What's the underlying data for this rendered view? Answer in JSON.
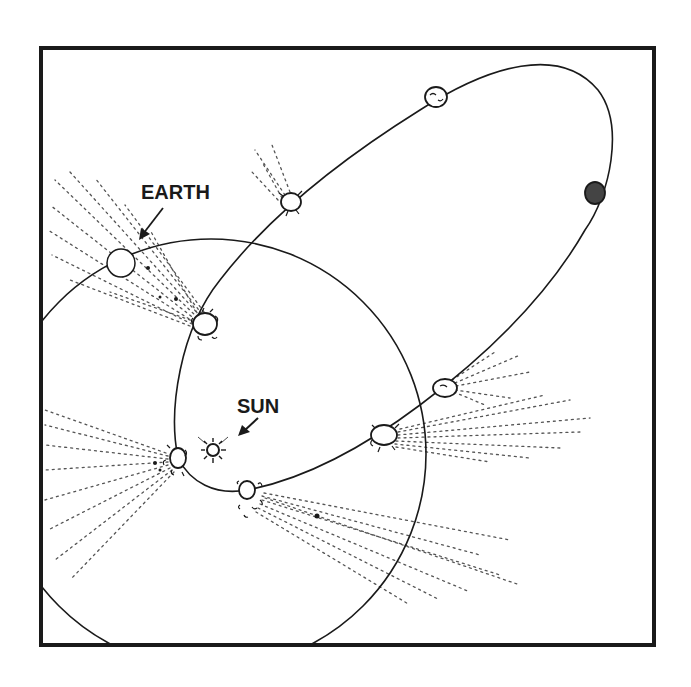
{
  "figure": {
    "type": "orbital-diagram",
    "colors": {
      "ink": "#1a1a1a",
      "tail": "#555555",
      "background": "#ffffff"
    }
  },
  "labels": {
    "earth": "EARTH",
    "sun": "SUN"
  },
  "bodies": {
    "sun": {
      "name": "sun",
      "cx": 213,
      "cy": 450
    },
    "earth": {
      "name": "earth",
      "cx": 121,
      "cy": 263,
      "r": 14
    }
  },
  "orbits": {
    "earth_orbit": {
      "cx": 211,
      "cy": 454,
      "r": 215
    },
    "comet_orbit": {
      "shape": "elongated ellipse",
      "perihelion_near": "sun",
      "aphelion_direction": "upper-right"
    }
  },
  "comet_positions": [
    {
      "id": 1,
      "cx": 436,
      "cy": 97,
      "tail": "none"
    },
    {
      "id": 2,
      "cx": 595,
      "cy": 193,
      "tail": "none"
    },
    {
      "id": 3,
      "cx": 291,
      "cy": 202,
      "tail": "short"
    },
    {
      "id": 4,
      "cx": 445,
      "cy": 388,
      "tail": "medium"
    },
    {
      "id": 5,
      "cx": 205,
      "cy": 324,
      "tail": "medium"
    },
    {
      "id": 6,
      "cx": 384,
      "cy": 435,
      "tail": "long"
    },
    {
      "id": 7,
      "cx": 178,
      "cy": 458,
      "tail": "long"
    },
    {
      "id": 8,
      "cx": 247,
      "cy": 490,
      "tail": "long"
    }
  ]
}
